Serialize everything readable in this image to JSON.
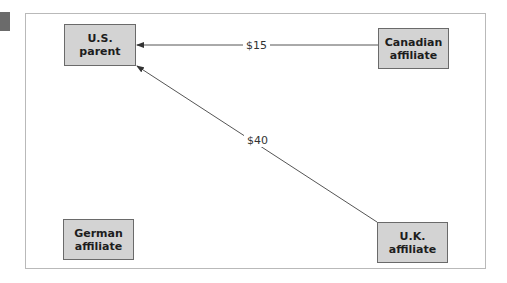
{
  "diagram": {
    "nodes": [
      {
        "id": "us_parent",
        "label": "U.S.\nparent"
      },
      {
        "id": "canadian_affiliate",
        "label": "Canadian\naffiliate"
      },
      {
        "id": "german_affiliate",
        "label": "German\naffiliate"
      },
      {
        "id": "uk_affiliate",
        "label": "U.K.\naffiliate"
      }
    ],
    "edges": [
      {
        "from": "canadian_affiliate",
        "to": "us_parent",
        "label": "$15"
      },
      {
        "from": "uk_affiliate",
        "to": "us_parent",
        "label": "$40"
      }
    ],
    "colors": {
      "node_fill": "#d3d3d3",
      "node_border": "#6a6a6a",
      "edge": "#555555",
      "frame": "#b9b9b9"
    }
  }
}
